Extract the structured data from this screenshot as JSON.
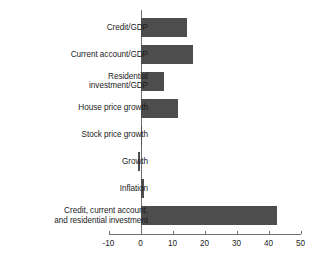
{
  "chart_data": {
    "type": "bar",
    "orientation": "horizontal",
    "title": "",
    "xlabel": "",
    "ylabel": "",
    "xlim": [
      -10,
      50
    ],
    "xticks": [
      -10,
      0,
      10,
      20,
      30,
      40,
      50
    ],
    "xtick_labels": [
      "-10",
      "0",
      "10",
      "20",
      "30",
      "40",
      "50"
    ],
    "grid": false,
    "legend": null,
    "bar_color": "#4d4d4d",
    "axis_color": "#6f6f6f",
    "text_color": "#1c1c1c",
    "categories": [
      "Credit/GDP",
      "Current account/GDP",
      "Residential\ninvestment/GDP",
      "House price growth",
      "Stock price growth",
      "Growth",
      "Inflation",
      "Credit, current account,\nand residential investment"
    ],
    "values": [
      14.5,
      16.3,
      7.2,
      11.6,
      0.1,
      -0.8,
      1.0,
      42.5
    ]
  }
}
